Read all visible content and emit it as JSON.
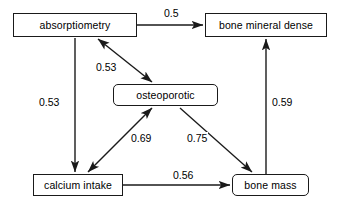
{
  "diagram": {
    "background_color": "#ffffff",
    "line_color": "#1a1a1a",
    "text_color": "#000000",
    "nodes": [
      {
        "id": "absorptiometry",
        "label": "absorptiometry",
        "shape": "rectangle",
        "x": 13,
        "y": 13,
        "w": 124,
        "h": 24
      },
      {
        "id": "bone_mineral_dense",
        "label": "bone mineral dense",
        "shape": "rectangle",
        "x": 205,
        "y": 13,
        "w": 122,
        "h": 24
      },
      {
        "id": "osteoporotic",
        "label": "osteoporotic",
        "shape": "rounded-rectangle",
        "x": 113,
        "y": 84,
        "w": 105,
        "h": 22
      },
      {
        "id": "calcium_intake",
        "label": "calcium intake",
        "shape": "rectangle",
        "x": 33,
        "y": 174,
        "w": 90,
        "h": 22
      },
      {
        "id": "bone_mass",
        "label": "bone mass",
        "shape": "rounded-rectangle",
        "x": 232,
        "y": 174,
        "w": 77,
        "h": 22
      }
    ],
    "edges": [
      {
        "id": "e1",
        "from": "absorptiometry",
        "to": "bone_mineral_dense",
        "weight": "0.5",
        "arrows": "single",
        "label_x": 163,
        "label_y": 7
      },
      {
        "id": "e2",
        "from": "absorptiometry",
        "to": "osteoporotic",
        "weight": "0.53",
        "arrows": "double",
        "label_x": 95,
        "label_y": 61
      },
      {
        "id": "e3",
        "from": "absorptiometry",
        "to": "calcium_intake",
        "weight": "0.53",
        "arrows": "single",
        "label_x": 38,
        "label_y": 96
      },
      {
        "id": "e4",
        "from": "calcium_intake",
        "to": "osteoporotic",
        "weight": "0.69",
        "arrows": "double",
        "label_x": 130,
        "label_y": 132
      },
      {
        "id": "e5",
        "from": "osteoporotic",
        "to": "bone_mass",
        "weight": "0.75",
        "arrows": "single",
        "label_x": 186,
        "label_y": 132
      },
      {
        "id": "e6",
        "from": "bone_mass",
        "to": "bone_mineral_dense",
        "weight": "0.59",
        "arrows": "single",
        "label_x": 271,
        "label_y": 96
      },
      {
        "id": "e7",
        "from": "calcium_intake",
        "to": "bone_mass",
        "weight": "0.56",
        "arrows": "single",
        "label_x": 172,
        "label_y": 169
      }
    ]
  }
}
